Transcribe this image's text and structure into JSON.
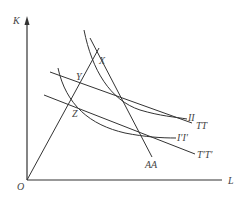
{
  "diagram": {
    "axes": {
      "y_label": "K",
      "x_label": "L",
      "origin_label": "O"
    },
    "points": [
      {
        "id": "X",
        "label": "X"
      },
      {
        "id": "Y",
        "label": "Y"
      },
      {
        "id": "Z",
        "label": "Z"
      }
    ],
    "curves": [
      {
        "id": "II",
        "label": "II",
        "type": "isoquant"
      },
      {
        "id": "I2",
        "label": "I′I′",
        "type": "isoquant"
      },
      {
        "id": "TT",
        "label": "TT",
        "type": "isocost-line"
      },
      {
        "id": "T2",
        "label": "T′T′",
        "type": "isocost-line"
      },
      {
        "id": "AA",
        "label": "AA",
        "type": "line"
      }
    ],
    "colors": {
      "stroke": "#333333",
      "label": "#444444",
      "background": "#ffffff"
    }
  }
}
